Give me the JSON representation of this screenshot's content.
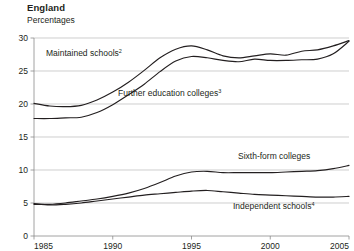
{
  "header": {
    "title": "England",
    "subtitle": "Percentages"
  },
  "chart_data": {
    "type": "line",
    "title": "England",
    "subtitle": "Percentages",
    "xlabel": "",
    "ylabel": "Percentages",
    "xlim": [
      1985,
      2005
    ],
    "ylim": [
      0,
      30
    ],
    "yticks": [
      0,
      5,
      10,
      15,
      20,
      25,
      30
    ],
    "ytick_labels": [
      "0",
      "5",
      "10",
      "15",
      "20",
      "25",
      "30"
    ],
    "xticks": [
      1985,
      1990,
      1995,
      2000,
      2005
    ],
    "xtick_labels": [
      "1985",
      "1990",
      "1995",
      "2000",
      "2005"
    ],
    "grid": "horizontal",
    "legend": "inline-annotations",
    "x": [
      1985,
      1986,
      1987,
      1988,
      1989,
      1990,
      1991,
      1992,
      1993,
      1994,
      1995,
      1996,
      1997,
      1998,
      1999,
      2000,
      2001,
      2002,
      2003,
      2004,
      2005
    ],
    "series": [
      {
        "name": "Maintained schools",
        "footnote": "2",
        "label": "Maintained schools",
        "label_sup": "2",
        "values": [
          20.1,
          19.7,
          19.6,
          19.8,
          20.6,
          21.8,
          23.3,
          25.1,
          27.0,
          28.3,
          28.8,
          28.2,
          27.3,
          27.0,
          27.3,
          27.6,
          27.4,
          28.0,
          28.2,
          28.8,
          29.6
        ]
      },
      {
        "name": "Further education colleges",
        "footnote": "3",
        "label": "Further education colleges",
        "label_sup": "3",
        "values": [
          17.8,
          17.8,
          17.9,
          18.0,
          18.7,
          19.9,
          21.4,
          23.0,
          24.9,
          26.5,
          27.2,
          27.0,
          26.6,
          26.4,
          26.8,
          26.6,
          26.6,
          26.7,
          26.8,
          27.6,
          29.5
        ]
      },
      {
        "name": "Sixth-form colleges",
        "footnote": "",
        "label": "Sixth-form colleges",
        "label_sup": "",
        "values": [
          4.8,
          4.8,
          5.0,
          5.3,
          5.6,
          6.0,
          6.5,
          7.2,
          8.1,
          9.1,
          9.7,
          9.8,
          9.6,
          9.6,
          9.6,
          9.6,
          9.7,
          9.8,
          9.9,
          10.2,
          10.7
        ]
      },
      {
        "name": "Independent schools",
        "footnote": "4",
        "label": "Independent schools",
        "label_sup": "4",
        "values": [
          4.9,
          4.7,
          4.8,
          5.0,
          5.3,
          5.6,
          5.9,
          6.2,
          6.4,
          6.6,
          6.8,
          6.9,
          6.7,
          6.5,
          6.3,
          6.2,
          6.1,
          6.0,
          5.9,
          5.9,
          6.0
        ]
      }
    ],
    "annotations": [
      {
        "text": "Maintained schools",
        "sup": "2",
        "x_px": 46,
        "y_px": 56
      },
      {
        "text": "Further education colleges",
        "sup": "3",
        "x_px": 118,
        "y_px": 96
      },
      {
        "text": "Sixth-form colleges",
        "sup": "",
        "x_px": 238,
        "y_px": 159
      },
      {
        "text": "Independent schools",
        "sup": "4",
        "x_px": 233,
        "y_px": 209
      }
    ]
  }
}
